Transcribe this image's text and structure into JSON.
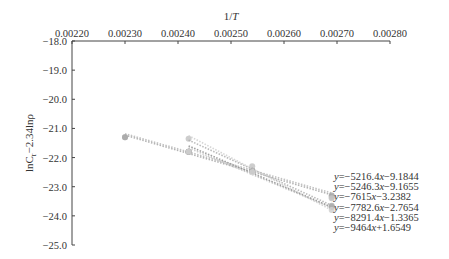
{
  "chart_data": {
    "type": "scatter",
    "title": "",
    "xlabel": "1/T",
    "ylabel": "lnC_r−2.34lnρ",
    "x_axis_position": "top",
    "xlim": [
      0.0022,
      0.0028
    ],
    "ylim": [
      -25.0,
      -18.0
    ],
    "x_ticks": [
      "0.00220",
      "0.00230",
      "0.00240",
      "0.00250",
      "0.00260",
      "0.00270",
      "0.00280"
    ],
    "y_ticks": [
      "-18.0",
      "-19.0",
      "-20.0",
      "-21.0",
      "-22.0",
      "-23.0",
      "-24.0",
      "-25.0"
    ],
    "grid": false,
    "legend_position": "right",
    "series": [
      {
        "name": "y=-5216.4x-9.1844",
        "slope": -5216.4,
        "intercept": -9.1844,
        "x": [
          0.0023,
          0.00242,
          0.00254,
          0.00269
        ],
        "y": [
          -21.3,
          -21.8,
          -22.45,
          -23.35
        ],
        "color": "#b8b8b8"
      },
      {
        "name": "y=-5246.3x-9.1655",
        "slope": -5246.3,
        "intercept": -9.1655,
        "x": [
          0.0023,
          0.00242,
          0.00254,
          0.00269
        ],
        "y": [
          -21.3,
          -21.8,
          -22.45,
          -23.3
        ],
        "color": "#a8a8a8"
      },
      {
        "name": "y=-7615x-3.2382",
        "slope": -7615,
        "intercept": -3.2382,
        "x": [
          0.00242,
          0.00254,
          0.00269
        ],
        "y": [
          -21.35,
          -22.3,
          -23.4
        ],
        "color": "#c4c4c4"
      },
      {
        "name": "y=-7782.6x-2.7654",
        "slope": -7782.6,
        "intercept": -2.7654,
        "x": [
          0.00242,
          0.00254,
          0.00269
        ],
        "y": [
          -21.8,
          -22.45,
          -23.7
        ],
        "color": "#909090"
      },
      {
        "name": "y=-8291.4x-1.3365",
        "slope": -8291.4,
        "intercept": -1.3365,
        "x": [
          0.00242,
          0.00254,
          0.00269
        ],
        "y": [
          -21.8,
          -22.45,
          -23.65
        ],
        "color": "#b0b0b0"
      },
      {
        "name": "y=-9464x+1.6549",
        "slope": -9464,
        "intercept": 1.6549,
        "x": [
          0.00242,
          0.00254,
          0.00269
        ],
        "y": [
          -21.8,
          -22.5,
          -23.8
        ],
        "color": "#d0d0d0"
      }
    ]
  },
  "axis": {
    "x_title": "1/T",
    "y_title_main": "lnC",
    "y_title_sub": "r",
    "y_title_rest": "−2.34lnρ"
  },
  "legend": [
    {
      "y": "y",
      "eq": "=−5216.4",
      "x": "x",
      "tail": "−9.1844"
    },
    {
      "y": "y",
      "eq": "=−5246.3",
      "x": "x",
      "tail": "−9.1655"
    },
    {
      "y": "y",
      "eq": "=−7615",
      "x": "x",
      "tail": "−3.2382"
    },
    {
      "y": "y",
      "eq": "=−7782.6",
      "x": "x",
      "tail": "−2.7654"
    },
    {
      "y": "y",
      "eq": "=−8291.4",
      "x": "x",
      "tail": "−1.3365"
    },
    {
      "y": "y",
      "eq": "=−9464",
      "x": "x",
      "tail": "+1.6549"
    }
  ]
}
